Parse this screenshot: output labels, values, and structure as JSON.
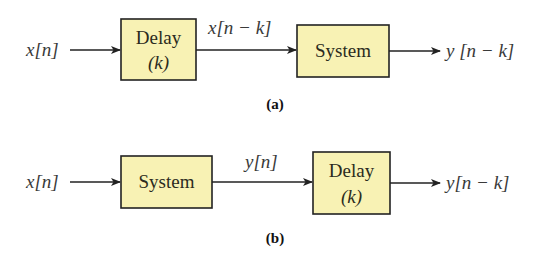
{
  "colors": {
    "box_fill": "#f8f2b4",
    "box_stroke": "#222222",
    "line": "#222222",
    "text": "#3a3a3a"
  },
  "diagram_a": {
    "caption": "(a)",
    "input_label": "x[n]",
    "block1": {
      "line1": "Delay",
      "line2": "(k)"
    },
    "intermediate_label": "x[n − k]",
    "block2": {
      "line1": "System"
    },
    "output_label": "y [n − k]"
  },
  "diagram_b": {
    "caption": "(b)",
    "input_label": "x[n]",
    "block1": {
      "line1": "System"
    },
    "intermediate_label": "y[n]",
    "block2": {
      "line1": "Delay",
      "line2": "(k)"
    },
    "output_label": "y[n − k]"
  }
}
